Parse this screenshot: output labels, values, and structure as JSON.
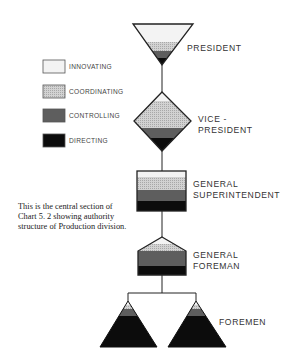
{
  "legend": [
    {
      "key": "innovating",
      "label": "INNOVATING",
      "color": "#f3f3f3"
    },
    {
      "key": "coordinating",
      "label": "COORDINATING",
      "color": "#c9c9c9"
    },
    {
      "key": "controlling",
      "label": "CONTROLLING",
      "color": "#5e5e5e"
    },
    {
      "key": "directing",
      "label": "DIRECTING",
      "color": "#0c0c0c"
    }
  ],
  "levels": {
    "president": {
      "label_lines": [
        "PRESIDENT"
      ],
      "shape": "inverted-triangle"
    },
    "vice_president": {
      "label_lines": [
        "VICE -",
        "PRESIDENT"
      ],
      "shape": "diamond"
    },
    "general_superintendent": {
      "label_lines": [
        "GENERAL",
        "SUPERINTENDENT"
      ],
      "shape": "rectangle"
    },
    "general_foreman": {
      "label_lines": [
        "GENERAL",
        "FOREMAN"
      ],
      "shape": "pentagon"
    },
    "foremen": {
      "label_lines": [
        "FOREMEN"
      ],
      "shape": "triangle",
      "count": 2
    }
  },
  "caption": [
    "This is the central section of",
    "Chart 5. 2  showing authority",
    "structure of Production division."
  ]
}
